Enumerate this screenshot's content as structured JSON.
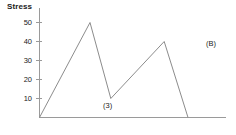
{
  "chart_data": {
    "type": "line",
    "title": "",
    "panel_label": "(B)",
    "ylabel": "Stress",
    "xlabel": "",
    "grid": false,
    "legend": "none",
    "ylim": [
      0,
      55
    ],
    "xlim": [
      0,
      100
    ],
    "yticks": [
      10,
      20,
      30,
      40,
      50
    ],
    "ytick_labels": [
      "10",
      "20",
      "30",
      "40",
      "50"
    ],
    "xticks": [],
    "xtick_labels": [],
    "x": [
      0,
      34,
      48,
      84,
      100
    ],
    "values": [
      0,
      50,
      10,
      40,
      0
    ],
    "series": [
      {
        "name": "Stress",
        "x": [
          0,
          34,
          48,
          84,
          100
        ],
        "values": [
          0,
          50,
          10,
          40,
          0
        ],
        "color": "#8c8c8c"
      }
    ],
    "annotations": [
      {
        "text": "(3)",
        "x": 48,
        "y": 10,
        "describes": "valley-between-peaks"
      }
    ]
  },
  "axis": {
    "y_title": "Stress",
    "ticks": [
      {
        "label": "50",
        "value": 50
      },
      {
        "label": "40",
        "value": 40
      },
      {
        "label": "30",
        "value": 30
      },
      {
        "label": "20",
        "value": 20
      },
      {
        "label": "10",
        "value": 10
      }
    ]
  },
  "labels": {
    "valley": "(3)",
    "panel": "(B)"
  },
  "colors": {
    "line": "#8c8c8c",
    "axis": "#9a9a9a",
    "text": "#1a1a1a",
    "background": "#ffffff"
  }
}
